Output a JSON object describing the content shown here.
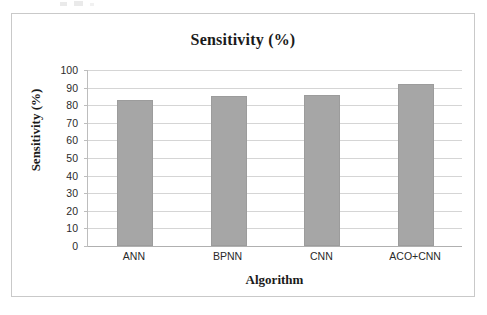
{
  "figure": {
    "background_color": "#ffffff",
    "frame_color": "#c9c9c9"
  },
  "chart_data": {
    "type": "bar",
    "title": "Sensitivity (%)",
    "xlabel": "Algorithm",
    "ylabel": "Sensitivity (%)",
    "categories": [
      "ANN",
      "BPNN",
      "CNN",
      "ACO+CNN"
    ],
    "values": [
      83,
      85,
      86,
      92
    ],
    "ylim": [
      0,
      100
    ],
    "ytick_step": 10,
    "yticks": [
      100,
      90,
      80,
      70,
      60,
      50,
      40,
      30,
      20,
      10,
      0
    ],
    "grid": true,
    "grid_axis": "y",
    "legend": false,
    "bar_color": "#a6a6a6",
    "bar_edge_color": "#9c9c9c",
    "gridline_color": "#d5d5d5",
    "axis_color": "#b0b0b0"
  }
}
